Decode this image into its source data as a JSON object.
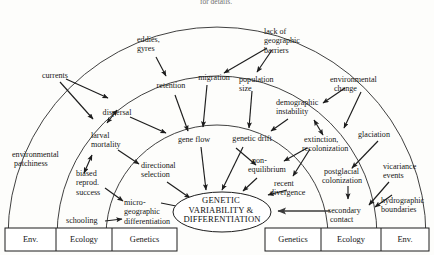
{
  "figure": {
    "title_clipped": "for details.",
    "center": {
      "line1": "GENETIC",
      "line2": "VARIABILITY &",
      "line3": "DIFFERENTIATION"
    }
  },
  "nodes": {
    "currents": "currents",
    "eddies_gyres_l1": "eddies,",
    "eddies_gyres_l2": "gyres",
    "lack_barriers_l1": "lack of",
    "lack_barriers_l2": "geographic",
    "lack_barriers_l3": "barriers",
    "environmental_change_l1": "environmental",
    "environmental_change_l2": "change",
    "environmental_patchiness_l1": "environmental",
    "environmental_patchiness_l2": "patchiness",
    "dispersal": "dispersal",
    "retention": "retention",
    "migration": "migration",
    "population_size_l1": "population",
    "population_size_l2": "size",
    "demographic_instability_l1": "demographic",
    "demographic_instability_l2": "instability",
    "glaciation": "glaciation",
    "larval_mortality_l1": "larval",
    "larval_mortality_l2": "mortality",
    "gene_flow": "gene flow",
    "genetic_drift": "genetic drift",
    "extinction_recolonization_l1": "extinction,",
    "extinction_recolonization_l2": "recolonization",
    "vicariance_events_l1": "vicariance",
    "vicariance_events_l2": "events",
    "biased_reprod_l1": "biased",
    "biased_reprod_l2": "reprod.",
    "biased_reprod_l3": "success",
    "directional_selection_l1": "directional",
    "directional_selection_l2": "selection",
    "non_equilibrium_l1": "non-",
    "non_equilibrium_l2": "equilibrium",
    "recent_divergence_l1": "recent",
    "recent_divergence_l2": "divergence",
    "postglacial_colonization_l1": "postglacial",
    "postglacial_colonization_l2": "colonization",
    "hydrographic_boundaries_l1": "hydrographic",
    "hydrographic_boundaries_l2": "boundaries",
    "schooling": "schooling",
    "micro_geographic_l1": "micro-",
    "micro_geographic_l2": "geographic",
    "micro_geographic_l3": "differentiation",
    "secondary_contact_l1": "secondary",
    "secondary_contact_l2": "contact"
  },
  "legend_left": {
    "cells": [
      "Env.",
      "Ecology",
      "Genetics"
    ]
  },
  "legend_right": {
    "cells": [
      "Genetics",
      "Ecology",
      "Env."
    ]
  },
  "colors": {
    "stroke": "#1d1d1d",
    "arc": "#2b2b2b",
    "background": "#fdfdfb",
    "text": "#161616"
  }
}
